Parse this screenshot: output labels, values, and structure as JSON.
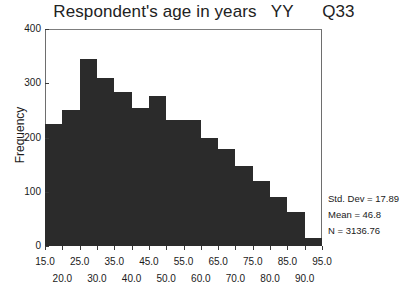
{
  "chart_data": {
    "type": "bar",
    "title": "Respondent's age in years   YY      Q33",
    "xlabel": "",
    "ylabel": "Frequency",
    "ylim": [
      0,
      400
    ],
    "xlim": [
      15,
      95
    ],
    "grid": false,
    "legend": null,
    "bin_width": 5,
    "bin_starts": [
      15,
      20,
      25,
      30,
      35,
      40,
      45,
      50,
      55,
      60,
      65,
      70,
      75,
      80,
      85,
      90
    ],
    "categories": [
      "15-20",
      "20-25",
      "25-30",
      "30-35",
      "35-40",
      "40-45",
      "45-50",
      "50-55",
      "55-60",
      "60-65",
      "65-70",
      "70-75",
      "75-80",
      "80-85",
      "85-90",
      "90-95"
    ],
    "values": [
      224,
      251,
      345,
      310,
      283,
      255,
      277,
      232,
      232,
      200,
      178,
      148,
      120,
      90,
      62,
      15
    ],
    "bar_color": "#2b2b2b",
    "y_ticks": [
      0,
      100,
      200,
      300,
      400
    ],
    "y_tick_labels": [
      "0",
      "100",
      "200",
      "300",
      "400"
    ],
    "x_ticks_upper": [
      15,
      25,
      35,
      45,
      55,
      65,
      75,
      85,
      95
    ],
    "x_tick_labels_upper": [
      "15.0",
      "25.0",
      "35.0",
      "45.0",
      "55.0",
      "65.0",
      "75.0",
      "85.0",
      "95.0"
    ],
    "x_ticks_lower": [
      20,
      30,
      40,
      50,
      60,
      70,
      80,
      90
    ],
    "x_tick_labels_lower": [
      "20.0",
      "30.0",
      "40.0",
      "50.0",
      "60.0",
      "70.0",
      "80.0",
      "90.0"
    ],
    "annotations": [
      "Std. Dev = 17.89",
      "Mean = 46.8",
      "N = 3136.76"
    ]
  },
  "stats": {
    "std_dev": "Std. Dev = 17.89",
    "mean": "Mean = 46.8",
    "n": "N = 3136.76"
  }
}
